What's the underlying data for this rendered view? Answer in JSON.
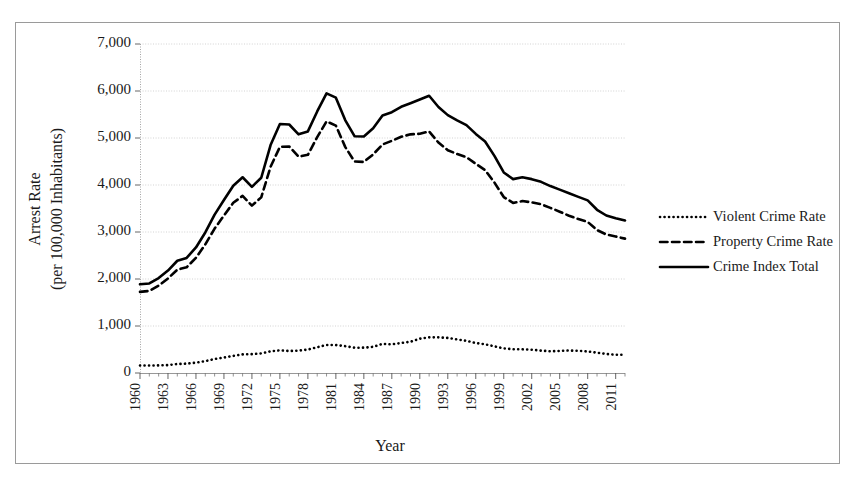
{
  "chart_data": {
    "type": "line",
    "title": "",
    "xlabel": "Year",
    "ylabel": "Arrest Rate\n(per 100,000 Inhabitants)",
    "ylabel_line1": "Arrest Rate",
    "ylabel_line2": "(per 100,000 Inhabitants)",
    "ylim": [
      0,
      7000
    ],
    "ytick_labels": [
      "0",
      "1,000",
      "2,000",
      "3,000",
      "4,000",
      "5,000",
      "6,000",
      "7,000"
    ],
    "ytick_values": [
      0,
      1000,
      2000,
      3000,
      4000,
      5000,
      6000,
      7000
    ],
    "xlim": [
      1960,
      2012
    ],
    "xtick_labels": [
      "1960",
      "1963",
      "1966",
      "1969",
      "1972",
      "1975",
      "1978",
      "1981",
      "1984",
      "1987",
      "1990",
      "1993",
      "1996",
      "1999",
      "2002",
      "2005",
      "2008",
      "2011"
    ],
    "xtick_values": [
      1960,
      1963,
      1966,
      1969,
      1972,
      1975,
      1978,
      1981,
      1984,
      1987,
      1990,
      1993,
      1996,
      1999,
      2002,
      2005,
      2008,
      2011
    ],
    "grid": true,
    "legend_position": "right",
    "x": [
      1960,
      1961,
      1962,
      1963,
      1964,
      1965,
      1966,
      1967,
      1968,
      1969,
      1970,
      1971,
      1972,
      1973,
      1974,
      1975,
      1976,
      1977,
      1978,
      1979,
      1980,
      1981,
      1982,
      1983,
      1984,
      1985,
      1986,
      1987,
      1988,
      1989,
      1990,
      1991,
      1992,
      1993,
      1994,
      1995,
      1996,
      1997,
      1998,
      1999,
      2000,
      2001,
      2002,
      2003,
      2004,
      2005,
      2006,
      2007,
      2008,
      2009,
      2010,
      2011,
      2012
    ],
    "series": [
      {
        "name": "Violent Crime Rate",
        "style": "dotted",
        "color": "#000000",
        "values": [
          161,
          158,
          162,
          168,
          191,
          200,
          220,
          253,
          298,
          329,
          364,
          396,
          401,
          417,
          461,
          482,
          468,
          476,
          498,
          549,
          597,
          594,
          571,
          538,
          539,
          557,
          620,
          610,
          637,
          666,
          730,
          758,
          758,
          747,
          714,
          685,
          637,
          611,
          568,
          523,
          507,
          504,
          495,
          476,
          463,
          469,
          479,
          472,
          458,
          432,
          405,
          387,
          387
        ]
      },
      {
        "name": "Property Crime Rate",
        "style": "dashed",
        "color": "#000000",
        "values": [
          1726,
          1747,
          1857,
          2012,
          2198,
          2249,
          2451,
          2737,
          3072,
          3351,
          3621,
          3769,
          3561,
          3737,
          4389,
          4811,
          4820,
          4602,
          4643,
          5017,
          5353,
          5264,
          4811,
          4500,
          4492,
          4651,
          4863,
          4940,
          5027,
          5078,
          5089,
          5140,
          4903,
          4740,
          4660,
          4591,
          4451,
          4316,
          4053,
          3744,
          3618,
          3658,
          3631,
          3591,
          3514,
          3432,
          3346,
          3276,
          3215,
          3041,
          2946,
          2905,
          2859
        ]
      },
      {
        "name": "Crime Index Total",
        "style": "solid",
        "color": "#000000",
        "values": [
          1887,
          1906,
          2019,
          2180,
          2388,
          2449,
          2671,
          2990,
          3370,
          3680,
          3985,
          4165,
          3961,
          4154,
          4850,
          5298,
          5287,
          5078,
          5140,
          5565,
          5950,
          5858,
          5381,
          5038,
          5031,
          5207,
          5480,
          5550,
          5664,
          5741,
          5820,
          5898,
          5660,
          5487,
          5374,
          5275,
          5087,
          4927,
          4620,
          4267,
          4125,
          4163,
          4125,
          4067,
          3977,
          3901,
          3825,
          3748,
          3673,
          3473,
          3351,
          3292,
          3246
        ]
      }
    ]
  },
  "legend": {
    "entries": [
      {
        "label": "Violent Crime Rate",
        "style": "dotted"
      },
      {
        "label": "Property Crime Rate",
        "style": "dashed"
      },
      {
        "label": "Crime Index Total",
        "style": "solid"
      }
    ]
  },
  "axes": {
    "x_title": "Year",
    "y_title_line1": "Arrest Rate",
    "y_title_line2": "(per 100,000 Inhabitants)"
  }
}
